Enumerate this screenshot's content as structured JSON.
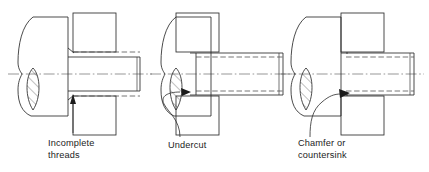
{
  "figure": {
    "background_color": "#ffffff",
    "line_color": "#2b2b2b",
    "hidden_line_color": "#4a4a4a",
    "center_line_color": "#6a6a6a",
    "text_color": "#1c1c1c",
    "view_count": 3
  },
  "views": [
    {
      "id": "view-incomplete-threads",
      "label_line1": "Incomplete",
      "label_line2": "threads",
      "label_x": 48,
      "label_y": 146,
      "callout_target": "runout of thread at shoulder",
      "detail_type": "incomplete-threads"
    },
    {
      "id": "view-undercut",
      "label_line1": "Undercut",
      "label_line2": "",
      "label_x": 168,
      "label_y": 148,
      "callout_target": "relief groove at thread end",
      "detail_type": "undercut"
    },
    {
      "id": "view-chamfer-countersink",
      "label_line1": "Chamfer or",
      "label_line2": "countersink",
      "label_x": 298,
      "label_y": 146,
      "callout_target": "angled relief at thread end",
      "detail_type": "chamfer-countersink"
    }
  ],
  "annotations": {
    "hatch_angle_degrees": 45,
    "hatch_spacing_px": 7,
    "centerline_style": "dash-dot chain",
    "hidden_line_style": "dashed"
  }
}
